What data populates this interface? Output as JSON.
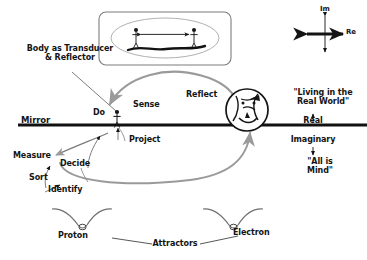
{
  "diagram": {
    "title_hidden": "",
    "background_color": "#ffffff",
    "ink_color": "#141414",
    "soft_ink_color": "#8d8d8d"
  },
  "labels": {
    "body_transducer": "Body as Transducer\n& Reflector",
    "do": "Do",
    "sense": "Sense",
    "mirror": "Mirror",
    "project": "Project",
    "reflect": "Reflect",
    "measure": "Measure",
    "decide": "Decide",
    "sort": "Sort",
    "identify": "Identify",
    "living_real_world": "\"Living in the\nReal World\"",
    "real": "Real",
    "imaginary": "Imaginary",
    "all_is_mind": "\"All is\nMind\"",
    "proton": "Proton",
    "electron": "Electron",
    "attractors": "Attractors",
    "im_axis": "Im",
    "re_axis": "Re"
  },
  "top_panel": {
    "name": "two-observers-panel",
    "figures": [
      "stick-figure-left",
      "stick-figure-right"
    ],
    "connector": "double-headed-arrow",
    "ground": "curved-ground-line",
    "frame": "rounded-rectangle",
    "inner_shape": "ellipse"
  },
  "mirror_line": {
    "name": "mirror-line",
    "orientation": "horizontal",
    "y": 125
  },
  "icons": {
    "head_circle": "reflected-self-circle-icon",
    "attractor_left": "proton-attractor-well-icon",
    "attractor_right": "electron-attractor-well-icon",
    "complex_axes": "complex-plane-axes-icon"
  }
}
